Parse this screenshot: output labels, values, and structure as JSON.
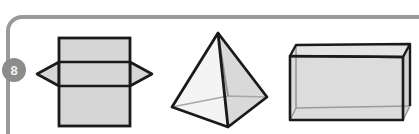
{
  "page": {
    "background_color": "#ffffff",
    "width": 419,
    "height": 134
  },
  "rule": {
    "name": "margin-rule",
    "color": "#9a9a9a",
    "stroke_width": 4,
    "corner_radius": 14
  },
  "badge": {
    "label": "8",
    "fill_color": "#8c8c8c",
    "text_color": "#f2f2f2",
    "center_x": 14,
    "center_y": 70,
    "radius": 12
  },
  "figures": [
    {
      "id": "prism-net",
      "name": "rectangular-prism-net",
      "label": "",
      "fill_color": "#d6d6d6",
      "stroke_color": "#1a1a1a",
      "description": "Square net with horizontal fold lines and triangular flaps on left and right"
    },
    {
      "id": "pyramid",
      "name": "square-pyramid",
      "label": "",
      "fill_light": "#f2f2f2",
      "fill_mid": "#e0e0e0",
      "fill_dark": "#cfcfcf",
      "stroke_color": "#1a1a1a",
      "description": "Square-based pyramid shown in perspective with hidden base edges visible"
    },
    {
      "id": "cuboid",
      "name": "transparent-cuboid",
      "label": "",
      "fill_color": "#e6e6e6",
      "fill_face": "#dcdcdc",
      "stroke_color": "#1a1a1a",
      "stroke_back_color": "#9a9a9a",
      "description": "Transparent rectangular box in perspective with back edges visible"
    }
  ]
}
